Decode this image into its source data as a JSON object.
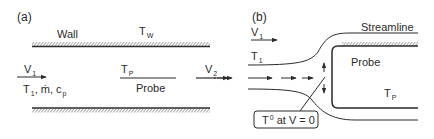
{
  "panel_a": {
    "tag": "(a)",
    "wall_label": "Wall",
    "wall_temp": {
      "base": "T",
      "sub": "W"
    },
    "inlet_velocity": {
      "base": "V",
      "sub": "1"
    },
    "inlet_props": {
      "t_base": "T",
      "t_sub": "1",
      "rest": ", ṁ, c",
      "c_sub": "p"
    },
    "probe_temp": {
      "base": "T",
      "sub": "P"
    },
    "probe_label": "Probe",
    "outlet_velocity": {
      "base": "V",
      "sub": "2"
    }
  },
  "panel_b": {
    "tag": "(b)",
    "streamline_label": "Streamline",
    "inlet_velocity": {
      "base": "V",
      "sub": "1"
    },
    "inlet_temp": {
      "base": "T",
      "sub": "1"
    },
    "probe_label": "Probe",
    "probe_temp": {
      "base": "T",
      "sub": "P"
    },
    "callout": {
      "base": "T",
      "sup": "0",
      "rest": " at V = 0"
    }
  },
  "colors": {
    "ink": "#2a2a2a",
    "background": "#ffffff"
  }
}
